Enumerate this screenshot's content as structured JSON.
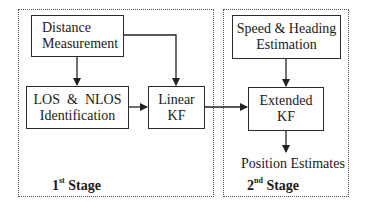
{
  "stages": [
    {
      "number": "1",
      "suffix": "st",
      "word": "Stage"
    },
    {
      "number": "2",
      "suffix": "nd",
      "word": "Stage"
    }
  ],
  "blocks": {
    "distance": {
      "line1": "Distance",
      "line2": "Measurement"
    },
    "los_nlos": {
      "line1": "LOS  &  NLOS",
      "line2": "Identification"
    },
    "linear_kf": {
      "line1": "Linear",
      "line2": "KF"
    },
    "speed_heading": {
      "line1": "Speed & Heading",
      "line2": "Estimation"
    },
    "extended_kf": {
      "line1": "Extended",
      "line2": "KF"
    }
  },
  "output_label": "Position Estimates",
  "edges": [
    {
      "from": "distance",
      "to": "los_nlos"
    },
    {
      "from": "distance",
      "to": "linear_kf"
    },
    {
      "from": "los_nlos",
      "to": "linear_kf"
    },
    {
      "from": "linear_kf",
      "to": "extended_kf"
    },
    {
      "from": "speed_heading",
      "to": "extended_kf"
    },
    {
      "from": "extended_kf",
      "to": "position_estimates"
    }
  ]
}
